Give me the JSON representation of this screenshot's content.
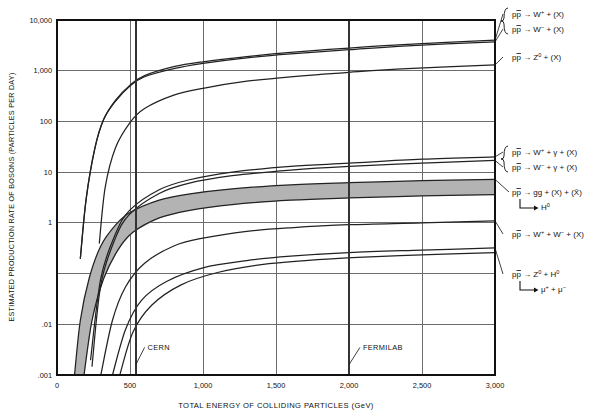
{
  "chart_data": {
    "type": "line",
    "title": "",
    "xlabel": "TOTAL ENERGY OF COLLIDING PARTICLES (GeV)",
    "ylabel": "ESTIMATED PRODUCTION RATE OF BOSONS (PARTICLES PER DAY)",
    "xlim": [
      0,
      3000
    ],
    "ylim": [
      0.001,
      10000
    ],
    "yscale": "log",
    "xscale": "linear",
    "grid": true,
    "legend_position": "right-outside",
    "xticks": [
      0,
      500,
      1000,
      1500,
      2000,
      2500,
      3000
    ],
    "xticklabels": [
      "0",
      "500",
      "1,000",
      "1,500",
      "2,000",
      "2,500",
      "3,000"
    ],
    "yticks": [
      10000,
      1000,
      100,
      10,
      1,
      0.1,
      0.01,
      0.001
    ],
    "yticklabels": [
      "10,000",
      "1,000",
      "100",
      "10",
      "1",
      "",
      ".01",
      ".001"
    ],
    "annotations": [
      {
        "name": "CERN",
        "text": "CERN",
        "x": 540,
        "label_x": 600,
        "label_y": 0.0035
      },
      {
        "name": "FERMILAB",
        "text": "FERMILAB",
        "x": 2000,
        "label_x": 2075,
        "label_y": 0.0035
      }
    ],
    "markers": [
      {
        "name": "cern-collider-line",
        "x": 540
      },
      {
        "name": "fermilab-collider-line",
        "x": 2000
      }
    ],
    "series": [
      {
        "name": "pp-to-W-plus-X",
        "label": "pp̄ → W⁺ + (X)",
        "points": [
          [
            160,
            0.2
          ],
          [
            200,
            3
          ],
          [
            260,
            30
          ],
          [
            320,
            110
          ],
          [
            400,
            260
          ],
          [
            500,
            520
          ],
          [
            600,
            800
          ],
          [
            800,
            1200
          ],
          [
            1000,
            1500
          ],
          [
            1300,
            1900
          ],
          [
            1600,
            2300
          ],
          [
            2000,
            2800
          ],
          [
            2400,
            3300
          ],
          [
            3000,
            4000
          ]
        ]
      },
      {
        "name": "pp-to-W-minus-X",
        "label": "pp̄ → W⁻ + (X)",
        "points": [
          [
            160,
            0.2
          ],
          [
            200,
            3
          ],
          [
            260,
            30
          ],
          [
            320,
            110
          ],
          [
            400,
            250
          ],
          [
            500,
            500
          ],
          [
            600,
            760
          ],
          [
            800,
            1100
          ],
          [
            1000,
            1400
          ],
          [
            1300,
            1800
          ],
          [
            1600,
            2150
          ],
          [
            2000,
            2600
          ],
          [
            2400,
            3100
          ],
          [
            3000,
            3700
          ]
        ]
      },
      {
        "name": "pp-to-Z0-X",
        "label": "pp̄ → Z⁰ + (X)",
        "points": [
          [
            290,
            0.4
          ],
          [
            330,
            5
          ],
          [
            400,
            30
          ],
          [
            500,
            95
          ],
          [
            600,
            180
          ],
          [
            800,
            330
          ],
          [
            1000,
            450
          ],
          [
            1300,
            620
          ],
          [
            1600,
            760
          ],
          [
            2000,
            930
          ],
          [
            2400,
            1100
          ],
          [
            3000,
            1300
          ]
        ]
      },
      {
        "name": "pp-to-W-plus-gamma-X",
        "label": "pp̄ → W⁺ + γ + (X)",
        "points": [
          [
            230,
            0.002
          ],
          [
            300,
            0.08
          ],
          [
            400,
            0.6
          ],
          [
            500,
            1.8
          ],
          [
            700,
            4.5
          ],
          [
            900,
            7
          ],
          [
            1200,
            10
          ],
          [
            1600,
            13
          ],
          [
            2000,
            15
          ],
          [
            2500,
            18
          ],
          [
            3000,
            20
          ]
        ]
      },
      {
        "name": "pp-to-W-minus-gamma-X",
        "label": "pp̄ → W⁻ + γ + (X)",
        "points": [
          [
            240,
            0.0015
          ],
          [
            300,
            0.06
          ],
          [
            400,
            0.5
          ],
          [
            500,
            1.5
          ],
          [
            700,
            3.8
          ],
          [
            900,
            6
          ],
          [
            1200,
            8.5
          ],
          [
            1600,
            11
          ],
          [
            2000,
            13
          ],
          [
            2500,
            15
          ],
          [
            3000,
            17
          ]
        ]
      },
      {
        "name": "pp-to-gg-X-higgs-band-upper",
        "label": "pp̄ → gg + (X) + (X̄)  → H⁰",
        "points": [
          [
            120,
            0.001
          ],
          [
            160,
            0.012
          ],
          [
            220,
            0.08
          ],
          [
            300,
            0.35
          ],
          [
            400,
            0.9
          ],
          [
            500,
            1.6
          ],
          [
            700,
            2.8
          ],
          [
            900,
            3.7
          ],
          [
            1200,
            4.7
          ],
          [
            1600,
            5.6
          ],
          [
            2000,
            6.2
          ],
          [
            2500,
            6.8
          ],
          [
            3000,
            7.2
          ]
        ]
      },
      {
        "name": "pp-to-gg-X-higgs-band-lower",
        "label": "",
        "points": [
          [
            185,
            0.001
          ],
          [
            240,
            0.012
          ],
          [
            320,
            0.08
          ],
          [
            420,
            0.3
          ],
          [
            520,
            0.65
          ],
          [
            700,
            1.25
          ],
          [
            900,
            1.75
          ],
          [
            1200,
            2.3
          ],
          [
            1600,
            2.8
          ],
          [
            2000,
            3.1
          ],
          [
            2500,
            3.4
          ],
          [
            3000,
            3.6
          ]
        ]
      },
      {
        "name": "pp-to-W-plus-W-minus-X",
        "label": "pp̄ → W⁺ + W⁻ + (X)",
        "points": [
          [
            300,
            0.001
          ],
          [
            380,
            0.012
          ],
          [
            470,
            0.055
          ],
          [
            600,
            0.16
          ],
          [
            800,
            0.35
          ],
          [
            1000,
            0.5
          ],
          [
            1300,
            0.68
          ],
          [
            1600,
            0.8
          ],
          [
            2000,
            0.92
          ],
          [
            2500,
            1.0
          ],
          [
            3000,
            1.1
          ]
        ]
      },
      {
        "name": "pp-to-Z0-H0-upper",
        "label": "pp̄ → Z⁰ + H⁰  → μ⁺ + μ⁻",
        "points": [
          [
            380,
            0.001
          ],
          [
            470,
            0.008
          ],
          [
            580,
            0.03
          ],
          [
            750,
            0.07
          ],
          [
            1000,
            0.13
          ],
          [
            1300,
            0.18
          ],
          [
            1600,
            0.22
          ],
          [
            2000,
            0.26
          ],
          [
            2500,
            0.29
          ],
          [
            3000,
            0.32
          ]
        ]
      },
      {
        "name": "pp-to-Z0-H0-lower",
        "label": "",
        "points": [
          [
            430,
            0.001
          ],
          [
            520,
            0.007
          ],
          [
            650,
            0.024
          ],
          [
            850,
            0.06
          ],
          [
            1100,
            0.105
          ],
          [
            1400,
            0.15
          ],
          [
            1700,
            0.18
          ],
          [
            2100,
            0.21
          ],
          [
            2600,
            0.24
          ],
          [
            3000,
            0.26
          ]
        ]
      }
    ],
    "band": {
      "name": "higgs-production-band",
      "color": "#b3b3b3",
      "upper_series": "pp-to-gg-X-higgs-band-upper",
      "lower_series": "pp-to-gg-X-higgs-band-lower"
    },
    "right_labels": [
      {
        "name": "label-w-plus-x",
        "group": "w-pair",
        "parts": [
          {
            "t": "pp",
            "s": "normal",
            "overbar_second": true
          },
          {
            "t": " → W",
            "s": "normal"
          },
          {
            "t": "+",
            "s": "sup"
          },
          {
            "t": " + (X)",
            "s": "normal"
          }
        ],
        "y": 17
      },
      {
        "name": "label-w-minus-x",
        "group": "w-pair",
        "parts": [
          {
            "t": "pp",
            "s": "normal",
            "overbar_second": true
          },
          {
            "t": " → W",
            "s": "normal"
          },
          {
            "t": "−",
            "s": "sup"
          },
          {
            "t": " + (X)",
            "s": "normal"
          }
        ],
        "y": 32
      },
      {
        "name": "label-z0-x",
        "group": "",
        "parts": [
          {
            "t": "pp",
            "s": "normal",
            "overbar_second": true
          },
          {
            "t": " → Z",
            "s": "normal"
          },
          {
            "t": "0",
            "s": "sup"
          },
          {
            "t": " + (X)",
            "s": "normal"
          }
        ],
        "y": 60
      },
      {
        "name": "label-w-plus-gamma-x",
        "group": "wgamma-pair",
        "parts": [
          {
            "t": "pp",
            "s": "normal",
            "overbar_second": true
          },
          {
            "t": " → W",
            "s": "normal"
          },
          {
            "t": "+",
            "s": "sup"
          },
          {
            "t": " + γ + (X)",
            "s": "normal"
          }
        ],
        "y": 155
      },
      {
        "name": "label-w-minus-gamma-x",
        "group": "wgamma-pair",
        "parts": [
          {
            "t": "pp",
            "s": "normal",
            "overbar_second": true
          },
          {
            "t": " → W",
            "s": "normal"
          },
          {
            "t": "−",
            "s": "sup"
          },
          {
            "t": " + γ + (X)",
            "s": "normal"
          }
        ],
        "y": 170
      },
      {
        "name": "label-gg-x-xbar",
        "group": "",
        "parts": [
          {
            "t": "pp",
            "s": "normal",
            "overbar_second": true
          },
          {
            "t": " → gg + (X) + (X̄)",
            "s": "normal"
          }
        ],
        "y": 195
      },
      {
        "name": "label-higgs-decay",
        "group": "",
        "decay": true,
        "parts": [
          {
            "t": "H",
            "s": "normal"
          },
          {
            "t": "0",
            "s": "sup"
          }
        ],
        "y": 210
      },
      {
        "name": "label-w-plus-w-minus-x",
        "group": "",
        "parts": [
          {
            "t": "pp",
            "s": "normal",
            "overbar_second": true
          },
          {
            "t": " → W",
            "s": "normal"
          },
          {
            "t": "+",
            "s": "sup"
          },
          {
            "t": " + W",
            "s": "normal"
          },
          {
            "t": "−",
            "s": "sup"
          },
          {
            "t": " + (X)",
            "s": "normal"
          }
        ],
        "y": 237
      },
      {
        "name": "label-z0-h0",
        "group": "",
        "parts": [
          {
            "t": "pp",
            "s": "normal",
            "overbar_second": true
          },
          {
            "t": " → Z",
            "s": "normal"
          },
          {
            "t": "0",
            "s": "sup"
          },
          {
            "t": " + H",
            "s": "normal"
          },
          {
            "t": "0",
            "s": "sup"
          }
        ],
        "y": 277
      },
      {
        "name": "label-mu-decay",
        "group": "",
        "decay": true,
        "parts": [
          {
            "t": "μ",
            "s": "normal"
          },
          {
            "t": "+",
            "s": "sup"
          },
          {
            "t": " + μ",
            "s": "normal"
          },
          {
            "t": "−",
            "s": "sup"
          }
        ],
        "y": 292
      }
    ]
  },
  "colors": {
    "curve": "#222222",
    "grid": "#6d6d6d",
    "axis": "#111111",
    "band": "#b4b4b4",
    "marker": "#333333",
    "background": "#ffffff"
  }
}
